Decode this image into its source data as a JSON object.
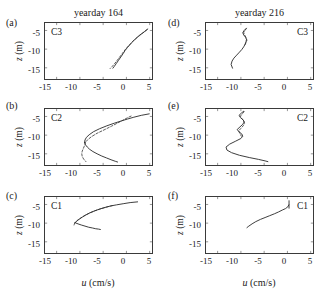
{
  "figure": {
    "columns": [
      {
        "id": "col-left",
        "title": "yearday 164"
      },
      {
        "id": "col-right",
        "title": "yearday 216"
      }
    ],
    "axis": {
      "xlabel_var": "u",
      "xlabel_units": " (cm/s)",
      "ylabel_var": "z",
      "ylabel_units": " (m)",
      "xticks": [
        "-15",
        "-10",
        "-5",
        "0",
        "5"
      ],
      "yticks": [
        "-5",
        "-10",
        "-15"
      ]
    },
    "panels": [
      {
        "letter": "(a)",
        "station": "C3",
        "column": "left",
        "station_side": "left"
      },
      {
        "letter": "(b)",
        "station": "C2",
        "column": "left",
        "station_side": "left"
      },
      {
        "letter": "(c)",
        "station": "C1",
        "column": "left",
        "station_side": "left"
      },
      {
        "letter": "(d)",
        "station": "C3",
        "column": "right",
        "station_side": "right"
      },
      {
        "letter": "(e)",
        "station": "C2",
        "column": "right",
        "station_side": "right"
      },
      {
        "letter": "(f)",
        "station": "C1",
        "column": "right",
        "station_side": "right"
      }
    ]
  },
  "chart_data": {
    "type": "line",
    "xlabel": "u (cm/s)",
    "ylabel": "z (m)",
    "xlim": [
      -17.5,
      5.5
    ],
    "ylim": [
      -18.0,
      -3.0
    ],
    "xticks": [
      -15,
      -10,
      -5,
      0,
      5
    ],
    "yticks": [
      -5,
      -10,
      -15
    ],
    "grid": false,
    "legend": null,
    "panels": [
      {
        "letter": "(a)",
        "station": "C3",
        "yearday": "yearday 164",
        "series": [
          {
            "name": "solid",
            "style": "solid",
            "x": [
              4.6,
              3.8,
              2.8,
              1.9,
              1.2,
              0.7,
              0.2,
              -0.3,
              -0.7,
              -1.2,
              -1.7,
              -2.2,
              -2.6,
              -2.9
            ],
            "y": [
              -4.6,
              -5.4,
              -6.3,
              -7.3,
              -8.2,
              -8.9,
              -9.6,
              -10.4,
              -11.2,
              -12.1,
              -13.0,
              -13.9,
              -14.6,
              -15.1
            ]
          },
          {
            "name": "dashed",
            "style": "dashed",
            "x": [
              4.4,
              3.5,
              2.5,
              1.6,
              0.9,
              0.3,
              -0.3,
              -0.9,
              -1.5,
              -2.1,
              -2.6,
              -3.1,
              -3.5
            ],
            "y": [
              -4.8,
              -5.7,
              -6.7,
              -7.6,
              -8.5,
              -9.3,
              -10.2,
              -11.2,
              -12.2,
              -13.2,
              -14.0,
              -14.7,
              -15.2
            ]
          }
        ]
      },
      {
        "letter": "(b)",
        "station": "C2",
        "yearday": "yearday 164",
        "series": [
          {
            "name": "solid-upper",
            "style": "solid",
            "x": [
              4.9,
              3.2,
              1.6,
              0.2,
              -1.1,
              -2.6,
              -4.2,
              -5.8,
              -7.1,
              -8.0,
              -8.6,
              -8.9,
              -9.0
            ],
            "y": [
              -4.3,
              -4.7,
              -5.2,
              -5.7,
              -6.2,
              -6.8,
              -7.5,
              -8.3,
              -9.1,
              -9.9,
              -10.6,
              -11.3,
              -12.0
            ]
          },
          {
            "name": "solid-lower",
            "style": "solid",
            "x": [
              -9.0,
              -8.8,
              -8.4,
              -7.9,
              -7.2,
              -6.3,
              -5.3,
              -4.3,
              -3.3,
              -2.4,
              -1.9
            ],
            "y": [
              -12.0,
              -12.6,
              -13.2,
              -13.8,
              -14.4,
              -15.0,
              -15.6,
              -16.1,
              -16.6,
              -17.0,
              -17.2
            ]
          },
          {
            "name": "dashed-upper",
            "style": "dashed",
            "x": [
              1.0,
              0.3,
              -0.6,
              -1.8,
              -3.2,
              -4.8,
              -6.3,
              -7.5,
              -8.3,
              -8.8
            ],
            "y": [
              -4.9,
              -5.3,
              -5.9,
              -6.7,
              -7.6,
              -8.6,
              -9.5,
              -10.4,
              -11.2,
              -11.9
            ]
          },
          {
            "name": "dashed-lower",
            "style": "dashed",
            "x": [
              -8.8,
              -8.9,
              -9.1,
              -9.3,
              -9.5,
              -9.6,
              -9.5,
              -9.2,
              -8.7
            ],
            "y": [
              -11.9,
              -12.5,
              -13.1,
              -13.7,
              -14.3,
              -15.0,
              -15.7,
              -16.4,
              -17.1
            ]
          }
        ]
      },
      {
        "letter": "(c)",
        "station": "C1",
        "yearday": "yearday 164",
        "series": [
          {
            "name": "solid-upper",
            "style": "solid",
            "x": [
              2.4,
              0.8,
              -0.7,
              -2.1,
              -3.4,
              -4.6,
              -5.7,
              -6.8,
              -7.8,
              -8.7,
              -9.5,
              -10.2,
              -10.7,
              -11.0
            ],
            "y": [
              -4.3,
              -4.5,
              -4.8,
              -5.1,
              -5.4,
              -5.8,
              -6.2,
              -6.7,
              -7.2,
              -7.8,
              -8.4,
              -9.0,
              -9.5,
              -9.9
            ]
          },
          {
            "name": "solid-lower",
            "style": "solid",
            "x": [
              -11.0,
              -10.4,
              -9.7,
              -8.9,
              -8.1,
              -7.3,
              -6.6,
              -6.0,
              -5.6
            ],
            "y": [
              -9.9,
              -10.2,
              -10.5,
              -10.8,
              -11.1,
              -11.3,
              -11.5,
              -11.6,
              -11.7
            ]
          },
          {
            "name": "dashed-upper",
            "style": "dashed",
            "x": [
              -3.0,
              -4.3,
              -5.6,
              -6.8,
              -7.9,
              -8.9,
              -9.8,
              -10.5,
              -11.1
            ],
            "y": [
              -5.3,
              -5.7,
              -6.2,
              -6.7,
              -7.3,
              -7.9,
              -8.6,
              -9.2,
              -9.9
            ]
          },
          {
            "name": "dashed-lower",
            "style": "dashed",
            "x": [
              -11.1,
              -11.2,
              -11.3
            ],
            "y": [
              -9.9,
              -10.3,
              -10.7
            ]
          }
        ]
      },
      {
        "letter": "(d)",
        "station": "C3",
        "yearday": "yearday 216",
        "series": [
          {
            "name": "solid",
            "style": "solid",
            "x": [
              -8.9,
              -9.3,
              -9.6,
              -9.4,
              -9.0,
              -8.8,
              -8.9,
              -9.1,
              -9.4,
              -9.8,
              -10.3,
              -10.9,
              -11.5,
              -11.9,
              -12.1,
              -11.8
            ],
            "y": [
              -4.5,
              -5.0,
              -5.6,
              -6.2,
              -6.8,
              -7.4,
              -8.0,
              -8.7,
              -9.4,
              -10.1,
              -10.8,
              -11.6,
              -12.4,
              -13.2,
              -14.1,
              -15.1
            ]
          },
          {
            "name": "dashed",
            "style": "dashed",
            "x": [
              -8.8,
              -9.1,
              -9.4,
              -9.2,
              -8.9,
              -8.7,
              -8.9,
              -9.2
            ],
            "y": [
              -4.4,
              -5.0,
              -5.6,
              -6.2,
              -6.9,
              -7.6,
              -8.3,
              -9.0
            ]
          }
        ]
      },
      {
        "letter": "(e)",
        "station": "C2",
        "yearday": "yearday 216",
        "series": [
          {
            "name": "solid",
            "style": "solid",
            "x": [
              -9.4,
              -9.9,
              -10.4,
              -10.1,
              -9.5,
              -9.3,
              -9.6,
              -10.2,
              -10.8,
              -10.4,
              -9.8,
              -9.6,
              -10.0,
              -11.1,
              -12.4,
              -13.2,
              -13.0,
              -12.0,
              -10.3,
              -8.2,
              -6.2,
              -4.8,
              -4.2
            ],
            "y": [
              -3.6,
              -4.1,
              -4.7,
              -5.3,
              -5.9,
              -6.5,
              -7.1,
              -7.8,
              -8.5,
              -9.1,
              -9.7,
              -10.3,
              -10.9,
              -11.6,
              -12.4,
              -13.2,
              -14.0,
              -14.7,
              -15.4,
              -16.0,
              -16.5,
              -16.9,
              -17.1
            ]
          },
          {
            "name": "dashed",
            "style": "dashed",
            "x": [
              -9.3,
              -9.7,
              -10.1,
              -9.9,
              -9.4,
              -9.2,
              -9.5,
              -10.0,
              -10.5,
              -10.2,
              -9.9
            ],
            "y": [
              -3.7,
              -4.3,
              -4.9,
              -5.5,
              -6.1,
              -6.8,
              -7.5,
              -8.2,
              -8.9,
              -9.6,
              -10.3
            ]
          }
        ]
      },
      {
        "letter": "(f)",
        "station": "C1",
        "yearday": "yearday 216",
        "series": [
          {
            "name": "solid",
            "style": "solid",
            "x": [
              0.3,
              0.1,
              -0.4,
              -1.1,
              -1.9,
              -2.8,
              -3.8,
              -4.8,
              -5.8,
              -6.8,
              -7.6,
              -8.3,
              -8.7
            ],
            "y": [
              -5.1,
              -5.6,
              -6.1,
              -6.5,
              -7.0,
              -7.5,
              -8.0,
              -8.5,
              -9.0,
              -9.6,
              -10.2,
              -10.8,
              -11.2
            ]
          },
          {
            "name": "tick-marker",
            "style": "solid",
            "x": [
              0.35,
              0.35
            ],
            "y": [
              -4.0,
              -6.0
            ]
          }
        ]
      }
    ]
  }
}
